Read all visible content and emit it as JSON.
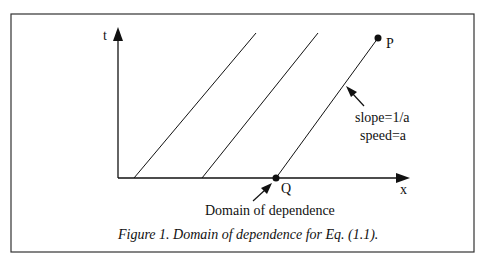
{
  "figure": {
    "caption": "Figure 1. Domain of dependence for Eq. (1.1).",
    "axes": {
      "x_label": "x",
      "y_label": "t"
    },
    "points": {
      "P": "P",
      "Q": "Q"
    },
    "annotations": {
      "slope": "slope=1/a",
      "speed": "speed=a",
      "domain": "Domain of dependence"
    },
    "characteristic_lines_count": 3,
    "colors": {
      "stroke": "#111111",
      "frame": "#333333",
      "background": "#ffffff"
    }
  }
}
